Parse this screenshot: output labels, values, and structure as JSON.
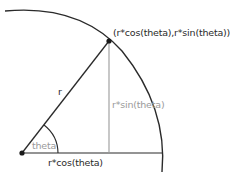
{
  "diagram": {
    "title": "",
    "labels": {
      "point": "(r*cos(theta),r*sin(theta))",
      "radius": "r",
      "opposite": "r*sin(theta)",
      "adjacent": "r*cos(theta)",
      "angle": "theta"
    },
    "colors": {
      "stroke_dark": "#2a2a2a",
      "stroke_gray": "#9a9a9a",
      "text_dark": "#2a2a2a",
      "text_gray": "#9a9a9a",
      "background": "#ffffff"
    },
    "geometry": {
      "origin": [
        22,
        153
      ],
      "point": [
        109,
        41
      ],
      "radius_px": 141,
      "angle_arc_radius_px": 36
    }
  }
}
